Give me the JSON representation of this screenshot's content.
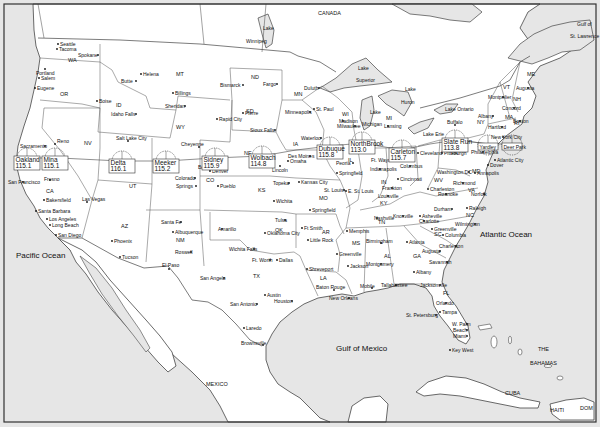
{
  "map": {
    "title": "United States railway stations map",
    "colors": {
      "water": "#e6e6e6",
      "land": "#ffffff",
      "border": "#444444",
      "frame": "#333333"
    },
    "oceans": [
      {
        "label": "Pacific Ocean",
        "x": 16,
        "y": 258
      },
      {
        "label": "Atlantic Ocean",
        "x": 480,
        "y": 237
      },
      {
        "label": "Gulf of Mexico",
        "x": 336,
        "y": 351
      },
      {
        "label": "Gulf of",
        "x": 577,
        "y": 26
      },
      {
        "label": "St. Lawrence",
        "x": 570,
        "y": 38
      }
    ],
    "countries": [
      {
        "label": "CANADA",
        "x": 318,
        "y": 15
      },
      {
        "label": "MEXICO",
        "x": 206,
        "y": 386
      },
      {
        "label": "CUBA",
        "x": 505,
        "y": 395
      },
      {
        "label": "THE",
        "x": 538,
        "y": 351
      },
      {
        "label": "BAHAMAS",
        "x": 530,
        "y": 365
      },
      {
        "label": "HAITI",
        "x": 550,
        "y": 412
      },
      {
        "label": "DOM",
        "x": 580,
        "y": 410
      }
    ],
    "lakes": [
      {
        "label": "Lake",
        "x": 263,
        "y": 30
      },
      {
        "label": "Winnipeg",
        "x": 246,
        "y": 43
      },
      {
        "label": "Lake",
        "x": 358,
        "y": 70
      },
      {
        "label": "Superior",
        "x": 356,
        "y": 82
      },
      {
        "label": "Lake",
        "x": 405,
        "y": 91
      },
      {
        "label": "Huron",
        "x": 401,
        "y": 104
      },
      {
        "label": "Lake",
        "x": 370,
        "y": 114
      },
      {
        "label": "Michigan",
        "x": 362,
        "y": 126
      },
      {
        "label": "Lake Ontario",
        "x": 445,
        "y": 111
      },
      {
        "label": "Lake Erie",
        "x": 423,
        "y": 136
      }
    ],
    "states": [
      {
        "label": "WA",
        "x": 68,
        "y": 62
      },
      {
        "label": "OR",
        "x": 60,
        "y": 96
      },
      {
        "label": "ID",
        "x": 116,
        "y": 107
      },
      {
        "label": "MT",
        "x": 176,
        "y": 76
      },
      {
        "label": "WY",
        "x": 176,
        "y": 129
      },
      {
        "label": "NV",
        "x": 84,
        "y": 145
      },
      {
        "label": "CA",
        "x": 46,
        "y": 193
      },
      {
        "label": "UT",
        "x": 129,
        "y": 188
      },
      {
        "label": "AZ",
        "x": 121,
        "y": 228
      },
      {
        "label": "NM",
        "x": 176,
        "y": 242
      },
      {
        "label": "CO",
        "x": 206,
        "y": 182
      },
      {
        "label": "ND",
        "x": 251,
        "y": 79
      },
      {
        "label": "SD",
        "x": 246,
        "y": 113
      },
      {
        "label": "NE",
        "x": 244,
        "y": 155
      },
      {
        "label": "KS",
        "x": 258,
        "y": 192
      },
      {
        "label": "OK",
        "x": 275,
        "y": 232
      },
      {
        "label": "TX",
        "x": 253,
        "y": 278
      },
      {
        "label": "MN",
        "x": 294,
        "y": 96
      },
      {
        "label": "IA",
        "x": 293,
        "y": 146
      },
      {
        "label": "MO",
        "x": 319,
        "y": 200
      },
      {
        "label": "AR",
        "x": 322,
        "y": 234
      },
      {
        "label": "LA",
        "x": 320,
        "y": 280
      },
      {
        "label": "WI",
        "x": 342,
        "y": 116
      },
      {
        "label": "IL",
        "x": 348,
        "y": 162
      },
      {
        "label": "MS",
        "x": 352,
        "y": 245
      },
      {
        "label": "MI",
        "x": 386,
        "y": 120
      },
      {
        "label": "IN",
        "x": 381,
        "y": 184
      },
      {
        "label": "KY",
        "x": 380,
        "y": 205
      },
      {
        "label": "TN",
        "x": 378,
        "y": 224
      },
      {
        "label": "AL",
        "x": 384,
        "y": 258
      },
      {
        "label": "OH",
        "x": 406,
        "y": 158
      },
      {
        "label": "WV",
        "x": 434,
        "y": 182
      },
      {
        "label": "VA",
        "x": 468,
        "y": 192
      },
      {
        "label": "NC",
        "x": 466,
        "y": 217
      },
      {
        "label": "SC",
        "x": 434,
        "y": 236
      },
      {
        "label": "GA",
        "x": 413,
        "y": 258
      },
      {
        "label": "FL",
        "x": 443,
        "y": 295
      },
      {
        "label": "PA",
        "x": 451,
        "y": 155
      },
      {
        "label": "NY",
        "x": 477,
        "y": 124
      },
      {
        "label": "VT",
        "x": 503,
        "y": 89
      },
      {
        "label": "NH",
        "x": 513,
        "y": 101
      },
      {
        "label": "ME",
        "x": 527,
        "y": 76
      },
      {
        "label": "MA",
        "x": 505,
        "y": 119
      },
      {
        "label": "RI",
        "x": 514,
        "y": 125
      },
      {
        "label": "MD",
        "x": 472,
        "y": 173
      }
    ],
    "cities": [
      {
        "label": "Seattle",
        "x": 58,
        "y": 44,
        "dx": 2
      },
      {
        "label": "Tacoma",
        "x": 57,
        "y": 49,
        "dx": 2
      },
      {
        "label": "Spokane",
        "x": 98,
        "y": 55,
        "dx": -20
      },
      {
        "label": "Portland",
        "x": 45,
        "y": 69,
        "dx": -9,
        "dy": 4
      },
      {
        "label": "Salem",
        "x": 39,
        "y": 78,
        "dx": 2
      },
      {
        "label": "Eugene",
        "x": 35,
        "y": 88,
        "dx": 2
      },
      {
        "label": "Boise",
        "x": 97,
        "y": 101,
        "dx": 2
      },
      {
        "label": "Idaho Falls",
        "x": 136,
        "y": 114,
        "dx": -25
      },
      {
        "label": "Helena",
        "x": 141,
        "y": 74,
        "dx": 2
      },
      {
        "label": "Butte",
        "x": 136,
        "y": 81,
        "dx": -15
      },
      {
        "label": "Billings",
        "x": 173,
        "y": 93,
        "dx": 2
      },
      {
        "label": "Sheridan",
        "x": 185,
        "y": 106,
        "dx": -20
      },
      {
        "label": "Bismarck",
        "x": 243,
        "y": 85,
        "dx": -23
      },
      {
        "label": "Fargo",
        "x": 277,
        "y": 84,
        "dx": -14
      },
      {
        "label": "Pierre",
        "x": 243,
        "y": 113,
        "dx": 2
      },
      {
        "label": "Rapid City",
        "x": 217,
        "y": 119,
        "dx": 2
      },
      {
        "label": "Sioux Falls",
        "x": 275,
        "y": 130,
        "dx": -25
      },
      {
        "label": "Duluth",
        "x": 319,
        "y": 88,
        "dx": -15
      },
      {
        "label": "St. Paul",
        "x": 314,
        "y": 109,
        "dx": 2
      },
      {
        "label": "Minneapolis",
        "x": 310,
        "y": 112,
        "dx": -25
      },
      {
        "label": "Madison",
        "x": 343,
        "y": 121,
        "dx": -4
      },
      {
        "label": "Milwaukee",
        "x": 355,
        "y": 126,
        "dx": -18
      },
      {
        "label": "Lansing",
        "x": 388,
        "y": 126,
        "dx": -4
      },
      {
        "label": "Salt Lake City",
        "x": 128,
        "y": 141,
        "dx": -12,
        "dy": -3
      },
      {
        "label": "Cheyenne",
        "x": 199,
        "y": 147,
        "dx": -18,
        "dy": -3
      },
      {
        "label": "Reno",
        "x": 55,
        "y": 144,
        "dx": 2,
        "dy": -3
      },
      {
        "label": "Sacramento",
        "x": 45,
        "y": 146,
        "dx": -25
      },
      {
        "label": "San Francisco",
        "x": 23,
        "y": 182,
        "dx": -15
      },
      {
        "label": "Fresno",
        "x": 50,
        "y": 180,
        "dx": -6,
        "dy": -1
      },
      {
        "label": "Bakersfield",
        "x": 44,
        "y": 200,
        "dx": 2
      },
      {
        "label": "Santa Barbara",
        "x": 36,
        "y": 211,
        "dx": 2
      },
      {
        "label": "Los Angeles",
        "x": 47,
        "y": 219,
        "dx": 2
      },
      {
        "label": "Long Beach",
        "x": 50,
        "y": 225,
        "dx": 2
      },
      {
        "label": "San Diego",
        "x": 56,
        "y": 235,
        "dx": 2
      },
      {
        "label": "Las Vegas",
        "x": 87,
        "y": 202,
        "dx": -5,
        "dy": -3
      },
      {
        "label": "Phoenix",
        "x": 112,
        "y": 241,
        "dx": 2
      },
      {
        "label": "Tucson",
        "x": 120,
        "y": 257,
        "dx": 2
      },
      {
        "label": "Boulder",
        "x": 208,
        "y": 167,
        "dx": -10
      },
      {
        "label": "Denver",
        "x": 210,
        "y": 171,
        "dx": 2
      },
      {
        "label": "Colorado",
        "x": 195,
        "y": 178,
        "dx": -20
      },
      {
        "label": "Springs",
        "x": 196,
        "y": 186,
        "dx": -20
      },
      {
        "label": "Pueblo",
        "x": 218,
        "y": 186,
        "dx": 2
      },
      {
        "label": "Santa Fe",
        "x": 181,
        "y": 222,
        "dx": -20
      },
      {
        "label": "Albuquerque",
        "x": 173,
        "y": 232,
        "dx": 2
      },
      {
        "label": "Roswell",
        "x": 191,
        "y": 252,
        "dx": -16
      },
      {
        "label": "El Paso",
        "x": 169,
        "y": 269,
        "dx": -7,
        "dy": -4
      },
      {
        "label": "Amarillo",
        "x": 222,
        "y": 229,
        "dx": -4
      },
      {
        "label": "Wichita Falls",
        "x": 254,
        "y": 249,
        "dx": -25
      },
      {
        "label": "Ft. Worth",
        "x": 270,
        "y": 260,
        "dx": -18
      },
      {
        "label": "Dallas",
        "x": 277,
        "y": 260,
        "dx": 2
      },
      {
        "label": "San Angelo",
        "x": 224,
        "y": 278,
        "dx": -24
      },
      {
        "label": "Austin",
        "x": 265,
        "y": 295,
        "dx": 2
      },
      {
        "label": "San Antonio",
        "x": 257,
        "y": 304,
        "dx": -27
      },
      {
        "label": "Houston",
        "x": 292,
        "y": 301,
        "dx": -18
      },
      {
        "label": "Laredo",
        "x": 244,
        "y": 328,
        "dx": 2
      },
      {
        "label": "Brownsville",
        "x": 263,
        "y": 345,
        "dx": -22,
        "dy": -2
      },
      {
        "label": "Omaha",
        "x": 288,
        "y": 161,
        "dx": 2
      },
      {
        "label": "Lincoln",
        "x": 280,
        "y": 166,
        "dx": -8,
        "dy": 4
      },
      {
        "label": "Des Moines",
        "x": 310,
        "y": 156,
        "dx": -22
      },
      {
        "label": "Waterloo",
        "x": 321,
        "y": 138,
        "dx": -20
      },
      {
        "label": "Topeka",
        "x": 289,
        "y": 183,
        "dx": -16
      },
      {
        "label": "Kansas City",
        "x": 299,
        "y": 182,
        "dx": 2
      },
      {
        "label": "Wichita",
        "x": 274,
        "y": 201,
        "dx": 2
      },
      {
        "label": "Tulsa",
        "x": 285,
        "y": 220,
        "dx": -10
      },
      {
        "label": "Oklahoma City",
        "x": 265,
        "y": 233,
        "dx": 2
      },
      {
        "label": "Ft Smith",
        "x": 302,
        "y": 228,
        "dx": 2
      },
      {
        "label": "Little Rock",
        "x": 308,
        "y": 240,
        "dx": 2
      },
      {
        "label": "Springfield",
        "x": 310,
        "y": 210,
        "dx": 2
      },
      {
        "label": "St. Louis",
        "x": 344,
        "y": 190,
        "dx": -20
      },
      {
        "label": "E. St. Louis",
        "x": 346,
        "y": 191,
        "dx": 2
      },
      {
        "label": "Peoria",
        "x": 353,
        "y": 163,
        "dx": -17
      },
      {
        "label": "Springfield",
        "x": 337,
        "y": 173,
        "dx": 2
      },
      {
        "label": "Memphis",
        "x": 347,
        "y": 231,
        "dx": 2
      },
      {
        "label": "Greenville",
        "x": 337,
        "y": 254,
        "dx": 2
      },
      {
        "label": "Jackson",
        "x": 348,
        "y": 266,
        "dx": 2
      },
      {
        "label": "Shreveport",
        "x": 307,
        "y": 269,
        "dx": 2
      },
      {
        "label": "Baton Rouge",
        "x": 334,
        "y": 290,
        "dx": -18,
        "dy": -3
      },
      {
        "label": "New Orleans",
        "x": 349,
        "y": 298,
        "dx": -20
      },
      {
        "label": "Mobile",
        "x": 372,
        "y": 288,
        "dx": -12,
        "dy": -2
      },
      {
        "label": "Birmingham",
        "x": 381,
        "y": 243,
        "dx": -15,
        "dy": -2
      },
      {
        "label": "Montgomery",
        "x": 381,
        "y": 264,
        "dx": -15
      },
      {
        "label": "Nashville",
        "x": 377,
        "y": 218,
        "dx": -3
      },
      {
        "label": "Ft. Wayne",
        "x": 393,
        "y": 160,
        "dx": -22
      },
      {
        "label": "Indianapolis",
        "x": 380,
        "y": 169,
        "dx": -10
      },
      {
        "label": "Louisville",
        "x": 388,
        "y": 196,
        "dx": -10
      },
      {
        "label": "Frankton",
        "x": 392,
        "y": 188,
        "dx": -10
      },
      {
        "label": "Cincinnati",
        "x": 398,
        "y": 179,
        "dx": 2
      },
      {
        "label": "Columbus",
        "x": 410,
        "y": 166,
        "dx": -10
      },
      {
        "label": "Cleveland",
        "x": 418,
        "y": 153,
        "dx": 2
      },
      {
        "label": "Charleston",
        "x": 428,
        "y": 189,
        "dx": 2
      },
      {
        "label": "Pittsburgh",
        "x": 442,
        "y": 153,
        "dx": 2
      },
      {
        "label": "Washington DC",
        "x": 469,
        "y": 172,
        "dx": -32
      },
      {
        "label": "Annapolis",
        "x": 475,
        "y": 173,
        "dx": 2
      },
      {
        "label": "Richmond",
        "x": 463,
        "y": 183,
        "dx": -10
      },
      {
        "label": "Roanoke",
        "x": 446,
        "y": 194,
        "dx": -8
      },
      {
        "label": "Norfolk",
        "x": 484,
        "y": 194,
        "dx": -13
      },
      {
        "label": "Knoxville",
        "x": 403,
        "y": 216,
        "dx": -10
      },
      {
        "label": "Asheville",
        "x": 420,
        "y": 216,
        "dx": 2
      },
      {
        "label": "Charlotte",
        "x": 424,
        "y": 221,
        "dx": -5
      },
      {
        "label": "Durham",
        "x": 452,
        "y": 209,
        "dx": -18
      },
      {
        "label": "Raleigh",
        "x": 467,
        "y": 208,
        "dx": 2
      },
      {
        "label": "Wilmington",
        "x": 475,
        "y": 224,
        "dx": -20
      },
      {
        "label": "Greenville",
        "x": 432,
        "y": 229,
        "dx": 2
      },
      {
        "label": "Columbia",
        "x": 443,
        "y": 235,
        "dx": 2
      },
      {
        "label": "Charleston",
        "x": 456,
        "y": 246,
        "dx": -17
      },
      {
        "label": "Atlanta",
        "x": 407,
        "y": 242,
        "dx": 2
      },
      {
        "label": "Augusta",
        "x": 440,
        "y": 251,
        "dx": -18
      },
      {
        "label": "Savannah",
        "x": 447,
        "y": 262,
        "dx": -18
      },
      {
        "label": "Albany",
        "x": 414,
        "y": 272,
        "dx": 2
      },
      {
        "label": "Tallahassee",
        "x": 396,
        "y": 285,
        "dx": -15
      },
      {
        "label": "Jacksonville",
        "x": 440,
        "y": 285,
        "dx": -20
      },
      {
        "label": "Orlando",
        "x": 446,
        "y": 303,
        "dx": -10
      },
      {
        "label": "Tampa",
        "x": 440,
        "y": 312,
        "dx": 2
      },
      {
        "label": "St. Petersburg",
        "x": 436,
        "y": 315,
        "dx": -30
      },
      {
        "label": "W. Palm",
        "x": 467,
        "y": 324,
        "dx": -15
      },
      {
        "label": "Beach",
        "x": 467,
        "y": 330,
        "dx": -14
      },
      {
        "label": "Miami",
        "x": 467,
        "y": 336,
        "dx": -14
      },
      {
        "label": "Key West",
        "x": 450,
        "y": 350,
        "dx": 2
      },
      {
        "label": "Buffalo",
        "x": 455,
        "y": 125,
        "dx": -8,
        "dy": -3
      },
      {
        "label": "Albany",
        "x": 493,
        "y": 116,
        "dx": -15
      },
      {
        "label": "Hartford",
        "x": 502,
        "y": 127,
        "dx": -14
      },
      {
        "label": "Boston",
        "x": 520,
        "y": 121,
        "dx": -7
      },
      {
        "label": "Montpelier",
        "x": 503,
        "y": 97,
        "dx": -15
      },
      {
        "label": "Concord",
        "x": 514,
        "y": 108,
        "dx": -12
      },
      {
        "label": "Augusta",
        "x": 528,
        "y": 88,
        "dx": -12
      },
      {
        "label": "New York City",
        "x": 503,
        "y": 137,
        "dx": -12
      },
      {
        "label": "Philadelphia",
        "x": 483,
        "y": 152,
        "dx": -12
      },
      {
        "label": "Atlantic City",
        "x": 495,
        "y": 160,
        "dx": 2
      },
      {
        "label": "Dover",
        "x": 488,
        "y": 165,
        "dx": 2
      }
    ],
    "stations": [
      {
        "name": "Oakland",
        "value": "115.1",
        "cx": 27,
        "cy": 158
      },
      {
        "name": "Mina",
        "value": "115.1",
        "cx": 55,
        "cy": 158
      },
      {
        "name": "Delta",
        "value": "116.1",
        "cx": 122,
        "cy": 161
      },
      {
        "name": "Meeker",
        "value": "115.2",
        "cx": 166,
        "cy": 161
      },
      {
        "name": "Sidney",
        "value": "115.9",
        "cx": 215,
        "cy": 158
      },
      {
        "name": "Wolbach",
        "value": "114.8",
        "cx": 262,
        "cy": 156
      },
      {
        "name": "Dubuque",
        "value": "115.8",
        "cx": 330,
        "cy": 147
      },
      {
        "name": "NorthBrook",
        "value": "113.0",
        "cx": 362,
        "cy": 142
      },
      {
        "name": "Carleton",
        "value": "115.7",
        "cx": 402,
        "cy": 150
      },
      {
        "name": "Slate Run",
        "value": "113.8",
        "cx": 455,
        "cy": 140
      },
      {
        "name": "Yardley",
        "value": "",
        "cx": 488,
        "cy": 145
      },
      {
        "name": "Deer Park",
        "value": "",
        "cx": 512,
        "cy": 145
      }
    ]
  }
}
